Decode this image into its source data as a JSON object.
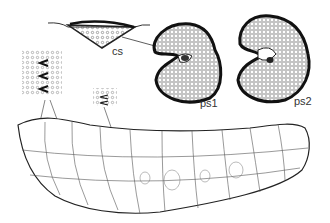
{
  "figure": {
    "labels": {
      "cs": "cs",
      "ps1": "ps1",
      "ps2": "ps2"
    },
    "parts": [
      "cross-section",
      "posterior-spiracle-1",
      "posterior-spiracle-2",
      "larva-body",
      "spine-detail-left",
      "spine-detail-middle"
    ]
  }
}
